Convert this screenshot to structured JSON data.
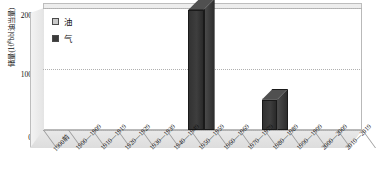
{
  "chart_data": {
    "type": "bar",
    "title": "",
    "xlabel": "",
    "ylabel": "储量(10⁸bbl油当量)",
    "ylim": [
      0,
      200
    ],
    "yticks": [
      "0",
      "100",
      "200"
    ],
    "grid": true,
    "legend_position": "top-left",
    "style": "3d-column",
    "categories": [
      "1900前",
      "1900—1909",
      "1910—1919",
      "1920—1929",
      "1930—1939",
      "1940—1949",
      "1950—1959",
      "1960—1969",
      "1970—1979",
      "1980—1989",
      "1990—1999",
      "2000—2009",
      "2010—2019"
    ],
    "series": [
      {
        "name": "油",
        "color": "#c9c9c9",
        "values": [
          0,
          0,
          0,
          0,
          0,
          0,
          0,
          0,
          0,
          0,
          0,
          0,
          0
        ]
      },
      {
        "name": "气",
        "color": "#3a3a3a",
        "values": [
          0,
          0,
          0,
          0,
          0,
          0,
          197,
          0,
          0,
          50,
          0,
          0,
          0
        ]
      }
    ]
  },
  "axis": {
    "y_title": "储量(10",
    "y_title_sup": "8",
    "y_title_tail": "bbl油当量)",
    "tick_200": "200",
    "tick_100": "100",
    "tick_0": "0"
  },
  "legend": {
    "items": [
      {
        "label": "油",
        "color": "#c9c9c9"
      },
      {
        "label": "气",
        "color": "#3a3a3a"
      }
    ]
  }
}
